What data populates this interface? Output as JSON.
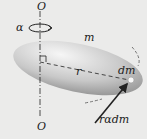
{
  "diagram": {
    "labels": {
      "axis_top": "O",
      "axis_bottom": "O",
      "alpha": "α",
      "mass": "m",
      "radius": "r",
      "element": "dm",
      "force": "rαdm"
    },
    "colors": {
      "background": "#ebebea",
      "body_light": "#f4f4f4",
      "body_dark": "#9a9a9a",
      "line": "#222222"
    }
  }
}
